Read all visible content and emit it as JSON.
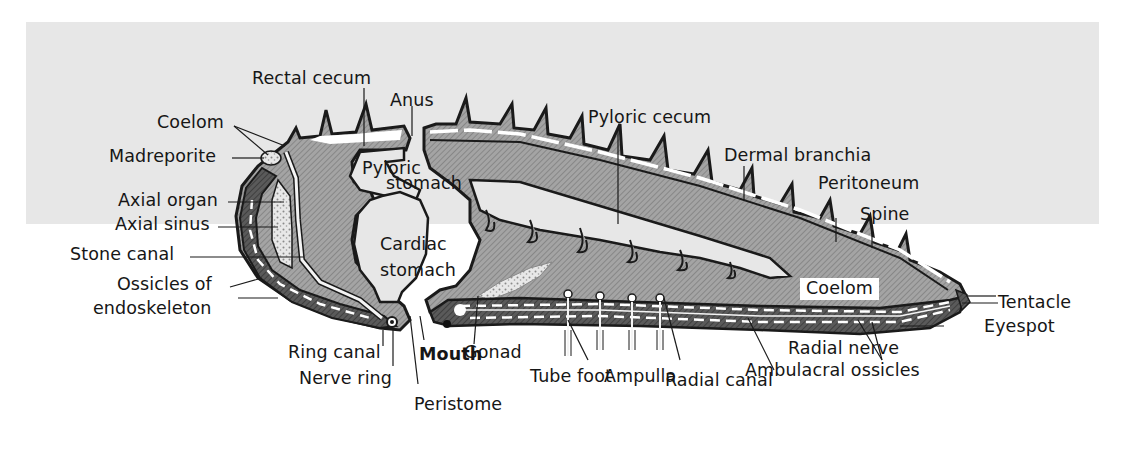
{
  "figure": {
    "background_color": "#e6e6e6",
    "body_fill_color": "#9c9c9c",
    "outline_color": "#1a1a1a",
    "labels": {
      "rectal_cecum": "Rectal cecum",
      "anus": "Anus",
      "coelom_top": "Coelom",
      "madreporite": "Madreporite",
      "pyloric_stomach_1": "Pyloric",
      "pyloric_stomach_2": "stomach",
      "axial_organ": "Axial organ",
      "axial_sinus": "Axial sinus",
      "stone_canal": "Stone canal",
      "ossicles_1": "Ossicles of",
      "ossicles_2": "endoskeleton",
      "cardiac_stomach_1": "Cardiac",
      "cardiac_stomach_2": "stomach",
      "ring_canal": "Ring canal",
      "nerve_ring": "Nerve ring",
      "mouth": "Mouth",
      "peristome": "Peristome",
      "gonad": "Gonad",
      "tube_foot": "Tube foot",
      "ampulla": "Ampulla",
      "radial_canal": "Radial canal",
      "ambulacral_ossicles": "Ambulacral ossicles",
      "radial_nerve": "Radial nerve",
      "eyespot": "Eyespot",
      "tentacle": "Tentacle",
      "coelom_arm": "Coelom",
      "spine": "Spine",
      "peritoneum": "Peritoneum",
      "dermal_branchia": "Dermal branchia",
      "pyloric_cecum": "Pyloric cecum"
    }
  }
}
